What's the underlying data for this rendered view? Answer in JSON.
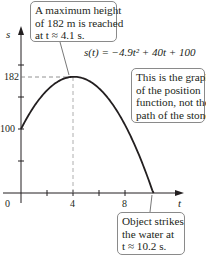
{
  "chart_data": {
    "type": "line",
    "title": "",
    "equation": "s(t) = −4.9t² + 40t + 100",
    "xlabel": "t",
    "ylabel": "s",
    "x_ticks": [
      "0",
      "4",
      "8"
    ],
    "y_ticks": [
      "100",
      "182"
    ],
    "xlim": [
      0,
      11
    ],
    "ylim": [
      0,
      210
    ],
    "series": [
      {
        "name": "s(t)",
        "x": [
          0,
          1,
          2,
          3,
          4,
          4.1,
          5,
          6,
          7,
          8,
          9,
          10,
          10.2
        ],
        "values": [
          100,
          135.1,
          160.4,
          175.9,
          181.6,
          181.6,
          177.5,
          163.6,
          139.9,
          106.4,
          63.1,
          10,
          0
        ]
      }
    ],
    "annotations": [
      {
        "text": "A maximum height of 182 m is reached at t ≈ 4.1 s.",
        "point": [
          4.1,
          182
        ]
      },
      {
        "text": "This is the graph of the position function, not the path of the stone."
      },
      {
        "text": "Object strikes the water at t ≈ 10.2 s.",
        "point": [
          10.2,
          0
        ]
      }
    ],
    "grid": false
  },
  "labels": {
    "s_axis": "s",
    "t_axis": "t",
    "equation": "s(t) = −4.9t² + 40t + 100",
    "tick_0": "0",
    "tick_4": "4",
    "tick_8": "8",
    "tick_100": "100",
    "tick_182": "182"
  },
  "callouts": {
    "max": [
      "A maximum height",
      "of 182 m is reached",
      "at t ≈ 4.1 s."
    ],
    "note": [
      "This is the graph",
      "of the position",
      "function, not the",
      "path of the stone."
    ],
    "strike": [
      "Object strikes",
      "the water at",
      "t ≈ 10.2 s."
    ]
  }
}
